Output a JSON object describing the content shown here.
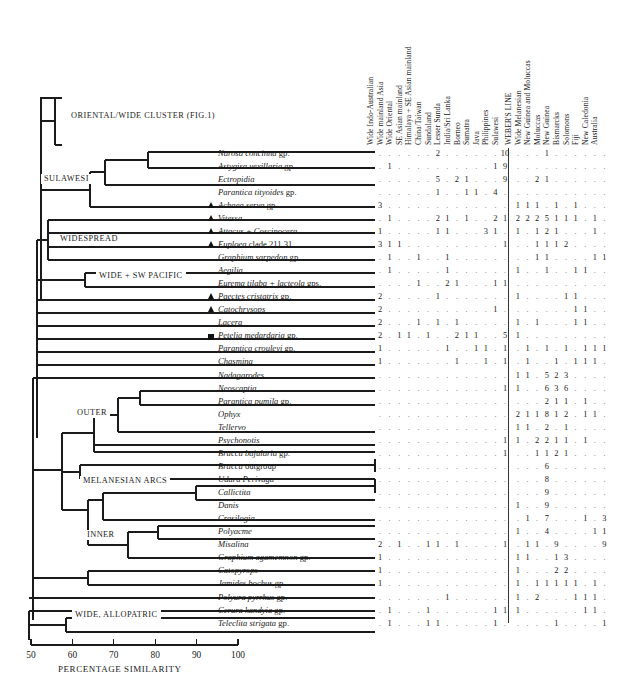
{
  "figure": {
    "axis": {
      "title": "PERCENTAGE SIMILARITY",
      "ticks": [
        "50",
        "60",
        "70",
        "80",
        "90",
        "100"
      ],
      "min": 50,
      "max": 100
    },
    "cluster_labels": [
      {
        "text": "ORIENTAL/WIDE CLUSTER (FIG.1)",
        "x": 68,
        "y": 116
      },
      {
        "text": "SULAWESI",
        "x": 41,
        "y": 179
      },
      {
        "text": "WIDESPREAD",
        "x": 57,
        "y": 239
      },
      {
        "text": "WIDE + SW PACIFIC",
        "x": 96,
        "y": 276
      },
      {
        "text": "OUTER",
        "x": 74,
        "y": 413
      },
      {
        "text": "MELANESIAN ARCS",
        "x": 80,
        "y": 481
      },
      {
        "text": "INNER",
        "x": 84,
        "y": 535
      },
      {
        "text": "WIDE, ALLOPATRIC",
        "x": 72,
        "y": 615
      }
    ],
    "column_headers": [
      "Wide Indo-Australian",
      "Wide mainland Asia",
      "Wide Oriental",
      "SE Asian mainland",
      "Himalaya + SE Asian mainland",
      "China/Taiwan",
      "Sundaland",
      "Lesser Sunda",
      "India/Sri Lanka",
      "Borneo",
      "Sumatra",
      "Java",
      "Philippines",
      "Sulawesi",
      "WEBER'S LINE",
      "Wide Melanesian",
      "New Guinea and Moluccas",
      "Moluccas",
      "New Guinea",
      "Bismarcks",
      "Solomons",
      "Fiji",
      "New Caledonia",
      "Australia"
    ],
    "rows": [
      {
        "taxon": "Narosa concinna gp.",
        "italic_upto": 2,
        "marker": "none",
        "values": [
          "",
          "",
          "",
          "",
          "",
          "",
          "2",
          "",
          "",
          "",
          "",
          "",
          "",
          "10",
          "",
          "",
          "",
          "1",
          "",
          "",
          "",
          "",
          "",
          ""
        ]
      },
      {
        "taxon": "Astygisa vexillaria gp.",
        "italic_upto": 2,
        "marker": "none",
        "values": [
          "",
          "1",
          "",
          "",
          "",
          "",
          "",
          "",
          "",
          "",
          "",
          "",
          "1",
          "9",
          "",
          "",
          "",
          "",
          "",
          "",
          "",
          "",
          "",
          ""
        ]
      },
      {
        "taxon": "Ectropidia",
        "italic_upto": 1,
        "marker": "none",
        "values": [
          "",
          "",
          "",
          "",
          "",
          "",
          "5",
          "",
          "2",
          "1",
          "",
          "",
          "",
          "9",
          "",
          "",
          "2",
          "1",
          "",
          "",
          "",
          "",
          "",
          ""
        ]
      },
      {
        "taxon": "Parantica tityoides gp.",
        "italic_upto": 2,
        "marker": "none",
        "values": [
          "",
          "",
          "",
          "",
          "",
          "",
          "1",
          "",
          "",
          "1",
          "1",
          "",
          "4",
          "",
          "",
          "",
          "",
          "",
          "",
          "",
          "",
          "",
          "",
          ""
        ]
      },
      {
        "taxon": "Achaea serva gp.",
        "italic_upto": 2,
        "marker": "triangle",
        "values": [
          "3",
          "",
          "",
          "",
          "",
          "",
          "",
          "",
          "",
          "",
          "",
          "",
          "",
          "",
          "1",
          "1",
          "1",
          "",
          "1",
          "",
          "1",
          "",
          "",
          ""
        ]
      },
      {
        "taxon": "Vitessa",
        "italic_upto": 1,
        "marker": "triangle",
        "values": [
          "",
          "1",
          "",
          "",
          "",
          "",
          "2",
          "1",
          "",
          "1",
          "",
          "",
          "2",
          "1",
          "2",
          "2",
          "2",
          "5",
          "1",
          "1",
          "1",
          "",
          "1",
          ""
        ]
      },
      {
        "taxon": "Attacus + Coscinocera",
        "italic_upto": 3,
        "marker": "triangle",
        "values": [
          "1",
          "",
          "",
          "",
          "",
          "",
          "1",
          "1",
          "",
          "",
          "",
          "3",
          "1",
          "",
          "1",
          "",
          "1",
          "2",
          "1",
          "",
          "",
          "",
          "1",
          ""
        ]
      },
      {
        "taxon": "Euploea clade 211.31",
        "italic_upto": 1,
        "marker": "triangle",
        "values": [
          "3",
          "1",
          "1",
          "",
          "",
          "",
          "",
          "",
          "",
          "",
          "",
          "",
          "",
          "1",
          "",
          "",
          "1",
          "1",
          "1",
          "2",
          "",
          "",
          "",
          ""
        ]
      },
      {
        "taxon": "Graphium sarpedon gp.",
        "italic_upto": 2,
        "marker": "none",
        "values": [
          "",
          "1",
          "",
          "",
          "1",
          "",
          "",
          "1",
          "",
          "",
          "",
          "",
          "",
          "",
          "",
          "",
          "1",
          "1",
          "",
          "",
          "",
          "",
          "1",
          "1"
        ]
      },
      {
        "taxon": "Aegilia",
        "italic_upto": 1,
        "marker": "none",
        "values": [
          "",
          "1",
          "",
          "",
          "",
          "",
          "",
          "1",
          "",
          "",
          "",
          "",
          "",
          "",
          "1",
          "",
          "",
          "1",
          "",
          "",
          "1",
          "1",
          "",
          ""
        ]
      },
      {
        "taxon": "Eurema tilaba + lacteola gps.",
        "italic_upto": 4,
        "marker": "none",
        "values": [
          "",
          "",
          "",
          "",
          "1",
          "",
          "",
          "2",
          "1",
          "",
          "",
          "",
          "1",
          "1",
          "",
          "",
          "",
          "",
          "",
          "",
          "",
          "",
          "",
          ""
        ]
      },
      {
        "taxon": "Paectes cristatrix gp.",
        "italic_upto": 2,
        "marker": "triangle",
        "values": [
          "2",
          "",
          "",
          "",
          "",
          "",
          "1",
          "",
          "",
          "",
          "",
          "",
          "",
          "",
          "1",
          "",
          "",
          "",
          "",
          "1",
          "1",
          "",
          "",
          ""
        ]
      },
      {
        "taxon": "Catochrysops",
        "italic_upto": 1,
        "marker": "triangle",
        "values": [
          "2",
          "",
          "",
          "",
          "",
          "",
          "",
          "",
          "",
          "",
          "",
          "",
          "1",
          "",
          "",
          "",
          "",
          "",
          "",
          "",
          "1",
          "1",
          "",
          ""
        ]
      },
      {
        "taxon": "Lacera",
        "italic_upto": 1,
        "marker": "none",
        "values": [
          "2",
          "",
          "",
          "",
          "1",
          "",
          "1",
          "",
          "1",
          "",
          "",
          "",
          "",
          "",
          "1",
          "",
          "1",
          "",
          "",
          "",
          "1",
          "1",
          "",
          ""
        ]
      },
      {
        "taxon": "Petelia medardaria gp.",
        "italic_upto": 2,
        "marker": "square",
        "values": [
          "2",
          "",
          "1",
          "1",
          "",
          "1",
          "",
          "",
          "2",
          "1",
          "1",
          "",
          "",
          "5",
          "1",
          "",
          "",
          "",
          "",
          "",
          "",
          "",
          "",
          ""
        ]
      },
      {
        "taxon": "Parantica crouleyi gp.",
        "italic_upto": 2,
        "marker": "none",
        "values": [
          "1",
          "",
          "",
          "",
          "",
          "",
          "",
          "1",
          "",
          "",
          "1",
          "1",
          "",
          "1",
          "",
          "1",
          "",
          "1",
          "",
          "1",
          "",
          "1",
          "1",
          "1"
        ]
      },
      {
        "taxon": "Chasmina",
        "italic_upto": 1,
        "marker": "none",
        "values": [
          "1",
          "",
          "",
          "",
          "",
          "",
          "",
          "",
          "1",
          "",
          "",
          "1",
          "",
          "1",
          "",
          "1",
          "",
          "",
          "1",
          "",
          "1",
          "1",
          "1",
          ""
        ]
      },
      {
        "taxon": "Nadagarodes",
        "italic_upto": 1,
        "marker": "none",
        "values": [
          "",
          "",
          "",
          "",
          "",
          "",
          "",
          "",
          "",
          "",
          "",
          "",
          "",
          "",
          "1",
          "1",
          "",
          "5",
          "2",
          "3",
          "",
          "",
          "",
          ""
        ]
      },
      {
        "taxon": "Neoscaptia",
        "italic_upto": 1,
        "marker": "none",
        "values": [
          "",
          "",
          "",
          "",
          "",
          "",
          "",
          "",
          "",
          "",
          "",
          "",
          "",
          "1",
          "1",
          "",
          "",
          "6",
          "3",
          "6",
          "",
          "",
          "",
          ""
        ]
      },
      {
        "taxon": "Parantica pumila gp.",
        "italic_upto": 2,
        "marker": "none",
        "values": [
          "",
          "",
          "",
          "",
          "",
          "",
          "",
          "",
          "",
          "",
          "",
          "",
          "",
          "",
          "",
          "",
          "",
          "2",
          "1",
          "1",
          "",
          "1",
          "",
          ""
        ]
      },
      {
        "taxon": "Ophyx",
        "italic_upto": 1,
        "marker": "none",
        "values": [
          "",
          "",
          "",
          "",
          "",
          "",
          "",
          "",
          "",
          "",
          "",
          "",
          "",
          "",
          "2",
          "1",
          "1",
          "8",
          "1",
          "2",
          "",
          "1",
          "1",
          ""
        ]
      },
      {
        "taxon": "Tellervo",
        "italic_upto": 1,
        "marker": "none",
        "values": [
          "",
          "",
          "",
          "",
          "",
          "",
          "",
          "",
          "",
          "",
          "",
          "",
          "",
          "",
          "1",
          "1",
          "",
          "2",
          "",
          "1",
          "",
          "",
          "",
          ""
        ]
      },
      {
        "taxon": "Psychonotis",
        "italic_upto": 1,
        "marker": "none",
        "values": [
          "",
          "",
          "",
          "",
          "",
          "",
          "",
          "",
          "",
          "",
          "",
          "",
          "",
          "1",
          "1",
          "",
          "2",
          "2",
          "1",
          "1",
          "",
          "1",
          "",
          ""
        ]
      },
      {
        "taxon": "Bracca bajularia gp.",
        "italic_upto": 2,
        "marker": "none",
        "values": [
          "",
          "",
          "",
          "",
          "",
          "",
          "",
          "",
          "",
          "",
          "",
          "",
          "",
          "1",
          "",
          "",
          "1",
          "1",
          "2",
          "1",
          "",
          "",
          "",
          ""
        ]
      },
      {
        "taxon": "Bracca outgroup",
        "italic_upto": 1,
        "marker": "none",
        "values": [
          "",
          "",
          "",
          "",
          "",
          "",
          "",
          "",
          "",
          "",
          "",
          "",
          "",
          "",
          "",
          "",
          "",
          "6",
          "",
          "",
          "",
          "",
          "",
          ""
        ]
      },
      {
        "taxon": "Udara Perivaga",
        "italic_upto": 2,
        "marker": "none",
        "values": [
          "",
          "",
          "",
          "",
          "",
          "",
          "",
          "",
          "",
          "",
          "",
          "",
          "",
          "",
          "",
          "",
          "",
          "8",
          "",
          "",
          "",
          "",
          "",
          ""
        ]
      },
      {
        "taxon": "Callictita",
        "italic_upto": 1,
        "marker": "none",
        "values": [
          "",
          "",
          "",
          "",
          "",
          "",
          "",
          "",
          "",
          "",
          "",
          "",
          "",
          "",
          "",
          "",
          "",
          "9",
          "",
          "",
          "",
          "",
          "",
          ""
        ]
      },
      {
        "taxon": "Danis",
        "italic_upto": 1,
        "marker": "none",
        "values": [
          "",
          "",
          "",
          "",
          "",
          "",
          "",
          "",
          "",
          "",
          "",
          "",
          "",
          "",
          "1",
          "",
          "",
          "9",
          "",
          "",
          "",
          "",
          "",
          ""
        ]
      },
      {
        "taxon": "Crasilogia",
        "italic_upto": 1,
        "marker": "none",
        "values": [
          "",
          "",
          "",
          "",
          "",
          "",
          "",
          "",
          "",
          "",
          "",
          "",
          "",
          "",
          "",
          "1",
          "",
          "7",
          "",
          "",
          "",
          "1",
          "",
          "3"
        ]
      },
      {
        "taxon": "Polyacme",
        "italic_upto": 1,
        "marker": "none",
        "values": [
          "",
          "",
          "",
          "",
          "",
          "",
          "",
          "",
          "",
          "",
          "",
          "",
          "",
          "",
          "1",
          "",
          "",
          "4",
          "",
          "",
          "",
          "",
          "1",
          "1"
        ]
      },
      {
        "taxon": "Misalina",
        "italic_upto": 1,
        "marker": "none",
        "values": [
          "2",
          "",
          "1",
          "",
          "",
          "1",
          "1",
          "",
          "1",
          "",
          "",
          "",
          "",
          "1",
          "",
          "1",
          "1",
          "",
          "9",
          "",
          "",
          "",
          "",
          "9"
        ]
      },
      {
        "taxon": "Graphium agamemnon gp.",
        "italic_upto": 2,
        "marker": "none",
        "values": [
          "1",
          "",
          "",
          "",
          "",
          "",
          "",
          "",
          "",
          "",
          "",
          "",
          "",
          "",
          "1",
          "1",
          "",
          "",
          "1",
          "3",
          "",
          "",
          "",
          ""
        ]
      },
      {
        "taxon": "Catopyrops",
        "italic_upto": 1,
        "marker": "none",
        "values": [
          "1",
          "",
          "",
          "",
          "",
          "",
          "",
          "",
          "",
          "",
          "",
          "",
          "",
          "",
          "1",
          "",
          "",
          "",
          "2",
          "2",
          "",
          "",
          "",
          ""
        ]
      },
      {
        "taxon": "Jamides bochus gp.",
        "italic_upto": 2,
        "marker": "none",
        "values": [
          "1",
          "",
          "",
          "",
          "",
          "",
          "",
          "",
          "",
          "",
          "",
          "",
          "",
          "",
          "1",
          "",
          "1",
          "1",
          "1",
          "1",
          "1",
          "",
          "1",
          ""
        ]
      },
      {
        "taxon": "Polyura pyrrhus gp.",
        "italic_upto": 2,
        "marker": "none",
        "values": [
          "",
          "",
          "",
          "",
          "",
          "",
          "",
          "1",
          "",
          "",
          "",
          "",
          "",
          "",
          "1",
          "",
          "2",
          "",
          "",
          "",
          "1",
          "1",
          "1",
          ""
        ]
      },
      {
        "taxon": "Cerura kandyia gp.",
        "italic_upto": 2,
        "marker": "none",
        "values": [
          "",
          "1",
          "",
          "",
          "",
          "1",
          "",
          "",
          "",
          "",
          "",
          "",
          "1",
          "1",
          "1",
          "",
          "",
          "",
          "",
          "",
          "",
          "1",
          "1",
          ""
        ]
      },
      {
        "taxon": "Teleclita strigata gp.",
        "italic_upto": 2,
        "marker": "none",
        "values": [
          "",
          "1",
          "",
          "",
          "",
          "1",
          "1",
          "",
          "",
          "",
          "",
          "",
          "1",
          "",
          "",
          "",
          "",
          "",
          "1",
          "",
          "",
          "",
          "",
          "1"
        ]
      }
    ]
  },
  "chart_data": {
    "type": "table",
    "xlabel": "PERCENTAGE SIMILARITY",
    "ylabel": "",
    "xlim": [
      50,
      100
    ],
    "grid": false,
    "legend": "none"
  }
}
